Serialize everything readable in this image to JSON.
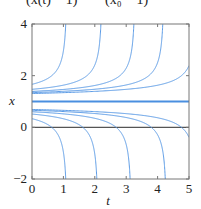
{
  "equation_fragment": {
    "left": "(x(t) − 1)²",
    "right": "(x₀ − 1)²"
  },
  "chart_data": {
    "type": "line",
    "title": "",
    "xlabel": "t",
    "ylabel": "x",
    "xlim": [
      0,
      5
    ],
    "ylim": [
      -2,
      4
    ],
    "xticks": [
      "0",
      "1",
      "2",
      "3",
      "4",
      "5"
    ],
    "yticks": [
      "-2",
      "0",
      "2",
      "4"
    ],
    "grid": false,
    "legend": null,
    "reference_line": {
      "y": 0,
      "color": "#555555"
    },
    "equilibrium": {
      "x": 1,
      "color": "#4a8fe0"
    },
    "series_color": "#5b9be6",
    "model": "x(t) = 1 ± 1/sqrt(2(T − t)), blow-up times T",
    "upper_blowup_T": [
      1.13,
      2.25,
      3.3,
      4.22,
      5.26
    ],
    "lower_blowup_T": [
      1.13,
      2.12,
      3.18,
      4.3,
      5.26
    ],
    "initial_values_upper": [
      1.67,
      1.47,
      1.39,
      1.34,
      1.31
    ],
    "initial_values_lower": [
      0.33,
      0.52,
      0.6,
      0.66,
      0.69
    ]
  }
}
